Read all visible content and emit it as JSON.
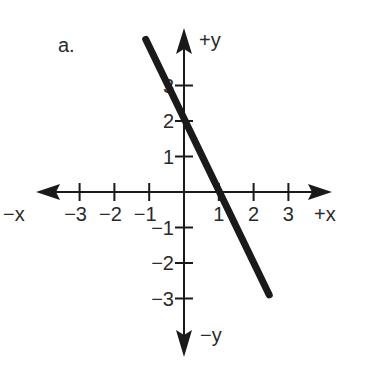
{
  "chart_data": {
    "type": "line",
    "title": "a.",
    "xlabel_pos": "+x",
    "xlabel_neg": "−x",
    "ylabel_pos": "+y",
    "ylabel_neg": "−y",
    "x_ticks": [
      -3,
      -2,
      -1,
      1,
      2,
      3
    ],
    "x_tick_labels": [
      "−3",
      "−2",
      "−1",
      "1",
      "2",
      "3"
    ],
    "y_ticks": [
      -3,
      -2,
      -1,
      1,
      2,
      3
    ],
    "y_tick_labels": [
      "−3",
      "−2",
      "−1",
      "1",
      "2",
      "3"
    ],
    "xlim": [
      -4,
      4
    ],
    "ylim": [
      -4.5,
      4.5
    ],
    "grid": false,
    "legend": null,
    "series": [
      {
        "name": "y = -2x + 2",
        "x": [
          -1.1,
          2.45
        ],
        "y": [
          4.3,
          -2.9
        ],
        "color": "#1a1a1a"
      }
    ]
  },
  "colors": {
    "ink": "#1a1a1a",
    "background": "#ffffff"
  }
}
